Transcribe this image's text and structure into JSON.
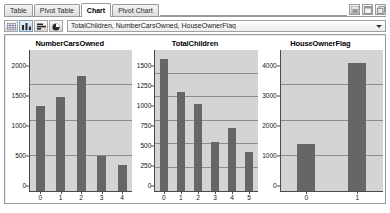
{
  "window": {
    "tabs": [
      {
        "label": "Table",
        "active": false
      },
      {
        "label": "Pivot Table",
        "active": false
      },
      {
        "label": "Chart",
        "active": true
      },
      {
        "label": "Pivot Chart",
        "active": false
      }
    ],
    "corner_buttons": [
      {
        "name": "pin-window-icon"
      },
      {
        "name": "maximize-window-icon"
      },
      {
        "name": "restore-window-icon"
      }
    ]
  },
  "toolbar": {
    "buttons": [
      {
        "name": "grid-view-icon",
        "selected": false
      },
      {
        "name": "bar-chart-icon",
        "selected": true
      },
      {
        "name": "horizontal-bar-chart-icon",
        "selected": false
      },
      {
        "name": "pie-chart-icon",
        "selected": false
      }
    ],
    "column_selector": {
      "value": "TotalChildren, NumberCarsOwned, HouseOwnerFlag",
      "placeholder": "Select columns"
    }
  },
  "colors": {
    "bar": "#666666",
    "plot_background": "#d4d4d4",
    "gridline": "#8d8d8d",
    "axis": "#4a4a4a"
  },
  "chart_data": [
    {
      "type": "bar",
      "title": "NumberCarsOwned",
      "xlabel": "",
      "ylabel": "",
      "categories": [
        "0",
        "1",
        "2",
        "3",
        "4"
      ],
      "values": [
        1200,
        1340,
        1630,
        490,
        370
      ],
      "yticks": [
        0,
        500,
        1000,
        1500,
        2000
      ],
      "ylim": [
        0,
        2000
      ],
      "grid": true,
      "legend": "none"
    },
    {
      "type": "bar",
      "title": "TotalChildren",
      "xlabel": "",
      "ylabel": "",
      "categories": [
        "0",
        "1",
        "2",
        "3",
        "4",
        "5"
      ],
      "values": [
        1400,
        1050,
        930,
        525,
        670,
        410
      ],
      "yticks": [
        0,
        250,
        500,
        750,
        1000,
        1250,
        1500
      ],
      "ylim": [
        0,
        1500
      ],
      "grid": true,
      "legend": "none"
    },
    {
      "type": "bar",
      "title": "HouseOwnerFlag",
      "xlabel": "",
      "ylabel": "",
      "categories": [
        "0",
        "1"
      ],
      "values": [
        1320,
        3630
      ],
      "yticks": [
        0,
        1000,
        2000,
        3000,
        4000
      ],
      "ylim": [
        0,
        4000
      ],
      "grid": true,
      "legend": "none"
    }
  ]
}
